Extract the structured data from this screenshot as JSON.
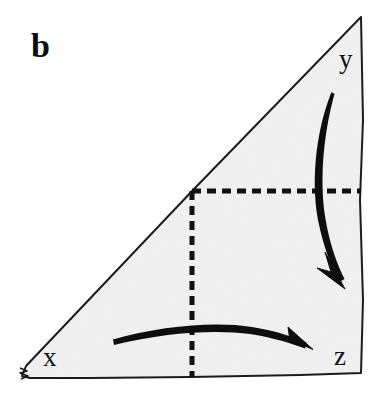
{
  "figure": {
    "panel_label": "b",
    "canvas": {
      "width": 386,
      "height": 405,
      "background": "#ffffff"
    },
    "shape": {
      "name": "right-triangle",
      "fill_color": "#f1f1f1",
      "stroke_color": "#1a1a1a",
      "stroke_width": 2,
      "vertices": [
        {
          "label": "x",
          "x": 22,
          "y": 376,
          "corner": "bottom-left"
        },
        {
          "label": "z",
          "x": 362,
          "y": 373,
          "corner": "bottom-right"
        },
        {
          "label": "y",
          "x": 362,
          "y": 17,
          "corner": "top-right"
        }
      ]
    },
    "vertex_labels": [
      {
        "text": "x",
        "x": 43,
        "y": 366
      },
      {
        "text": "y",
        "x": 339,
        "y": 68
      },
      {
        "text": "z",
        "x": 334,
        "y": 365
      }
    ],
    "dashed_lines": [
      {
        "name": "horizontal-dashed-line",
        "x1": 192,
        "y1": 191,
        "x2": 362,
        "y2": 191,
        "color": "#111111",
        "width": 5,
        "dash": "9 6"
      },
      {
        "name": "vertical-dashed-line",
        "x1": 192,
        "y1": 191,
        "x2": 192,
        "y2": 376,
        "color": "#111111",
        "width": 5,
        "dash": "9 6"
      }
    ],
    "arrows": [
      {
        "name": "right-curved-arrow",
        "from_label": "y",
        "to_label": "z",
        "start": {
          "x": 332,
          "y": 92
        },
        "end": {
          "x": 343,
          "y": 287
        },
        "direction": "downward",
        "color": "#0d0d0d"
      },
      {
        "name": "bottom-curved-arrow",
        "from_label": "x",
        "to_label": "z",
        "start": {
          "x": 113,
          "y": 341
        },
        "end": {
          "x": 312,
          "y": 348
        },
        "direction": "rightward",
        "color": "#0d0d0d"
      }
    ]
  }
}
